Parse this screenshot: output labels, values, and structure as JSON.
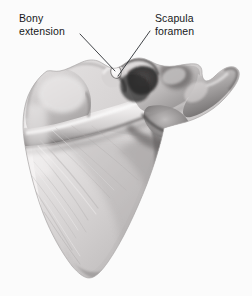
{
  "figure": {
    "view": "posterior",
    "background_color": "#fbfbfb",
    "width": 252,
    "height": 296
  },
  "annotations": [
    {
      "id": "bony-extension",
      "lines": [
        "Bony",
        "extension"
      ],
      "text": "Bony extension",
      "text_color": "#16181a",
      "leader": {
        "from_x": 80,
        "from_y": 34,
        "to_x": 115,
        "to_y": 71,
        "color": "#2b2f33"
      }
    },
    {
      "id": "scapula-foramen",
      "lines": [
        "Scapula",
        "foramen"
      ],
      "text": "Scapula foramen",
      "text_color": "#16181a",
      "leader": {
        "from_x": 150,
        "from_y": 31,
        "to_x": 118,
        "to_y": 76,
        "color": "#2b2f33"
      }
    }
  ],
  "palette": {
    "bone_light": "#eceaea",
    "bone_mid": "#c9c6c6",
    "bone_shadow": "#8d8a8a",
    "bone_dark": "#4a4848",
    "bone_darkest": "#2a2929",
    "outline": "#9b9898",
    "foramen_white": "#fdfdfd"
  }
}
